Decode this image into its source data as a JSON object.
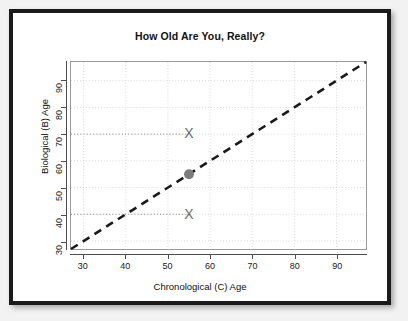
{
  "figure": {
    "title": "How Old Are You, Really?",
    "frame_color": "#1a1a1a",
    "background": "#ffffff"
  },
  "chart_data": {
    "type": "scatter",
    "title": "How Old Are You, Really?",
    "xlabel": "Chronological (C) Age",
    "ylabel": "Biological (B) Age",
    "xlim": [
      27,
      97
    ],
    "ylim": [
      27,
      97
    ],
    "xticks": [
      30,
      40,
      50,
      60,
      70,
      80,
      90
    ],
    "yticks": [
      30,
      40,
      50,
      60,
      70,
      80,
      90
    ],
    "grid": true,
    "grid_style": "dotted",
    "grid_color": "#d8d8d8",
    "legend": "none",
    "series": [
      {
        "name": "identity-line",
        "type": "line",
        "style": "dashed",
        "color": "#1a1a1a",
        "points": [
          [
            27,
            27
          ],
          [
            97,
            97
          ]
        ],
        "note": "y = x reference line (B Age equals C Age)"
      },
      {
        "name": "actual-age-point",
        "type": "point",
        "marker": "filled-circle",
        "color": "#7d7d7d",
        "points": [
          [
            55,
            55
          ]
        ],
        "note": "chronological age 55, biological age 55"
      },
      {
        "name": "older-biological-age",
        "type": "point",
        "marker": "x",
        "color": "#6b6b6b",
        "points": [
          [
            55,
            70
          ]
        ],
        "note": "biological age 70 at chronological age 55"
      },
      {
        "name": "younger-biological-age",
        "type": "point",
        "marker": "x",
        "color": "#6b6b6b",
        "points": [
          [
            55,
            40
          ]
        ],
        "note": "biological age 40 at chronological age 55"
      },
      {
        "name": "reference-dotted-upper",
        "type": "line",
        "style": "dotted",
        "color": "#8c8c8c",
        "points": [
          [
            27,
            70
          ],
          [
            55,
            70
          ]
        ],
        "note": "horizontal dotted guide from y-axis to upper X"
      },
      {
        "name": "reference-dotted-lower",
        "type": "line",
        "style": "dotted",
        "color": "#8c8c8c",
        "points": [
          [
            27,
            40
          ],
          [
            55,
            40
          ]
        ],
        "note": "horizontal dotted guide from y-axis to lower X"
      }
    ]
  }
}
